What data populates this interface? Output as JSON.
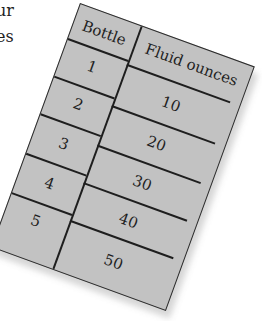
{
  "intro_text": [
    "ur",
    "es"
  ],
  "table": {
    "headers": [
      "Bottle",
      "Fluid ounces"
    ],
    "rows": [
      {
        "bottle": "1",
        "fluid_ounces": "10"
      },
      {
        "bottle": "2",
        "fluid_ounces": "20"
      },
      {
        "bottle": "3",
        "fluid_ounces": "30"
      },
      {
        "bottle": "4",
        "fluid_ounces": "40"
      },
      {
        "bottle": "5",
        "fluid_ounces": "50"
      }
    ]
  },
  "colors": {
    "card": "#c2c2c2",
    "ink": "#1e1e1e",
    "background": "#ffffff"
  }
}
